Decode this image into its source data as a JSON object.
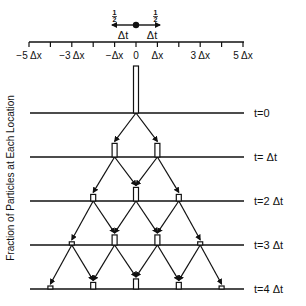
{
  "legend": {
    "left_fraction": "1/2",
    "right_fraction": "1/2",
    "left_label": "Δt",
    "right_label": "Δt"
  },
  "axis": {
    "tick_labels": [
      {
        "pos": -5,
        "text": "−5 Δx"
      },
      {
        "pos": -3,
        "text": "−3 Δx"
      },
      {
        "pos": -1,
        "text": "−Δx"
      },
      {
        "pos": 0,
        "text": "0"
      },
      {
        "pos": 1,
        "text": "Δx"
      },
      {
        "pos": 3,
        "text": "3 Δx"
      },
      {
        "pos": 5,
        "text": "5 Δx"
      }
    ],
    "tick_range": [
      -5,
      5
    ]
  },
  "ylabel": "Fraction of Particles at Each Location",
  "time_steps": [
    {
      "label": "t=0",
      "bars": [
        {
          "pos": 0,
          "fraction": 1
        }
      ]
    },
    {
      "label": "t= Δt",
      "bars": [
        {
          "pos": -1,
          "fraction": 0.5
        },
        {
          "pos": 1,
          "fraction": 0.5
        }
      ]
    },
    {
      "label": "t=2 Δt",
      "bars": [
        {
          "pos": -2,
          "fraction": 0.25
        },
        {
          "pos": 0,
          "fraction": 0.5
        },
        {
          "pos": 2,
          "fraction": 0.25
        }
      ]
    },
    {
      "label": "t=3 Δt",
      "bars": [
        {
          "pos": -3,
          "fraction": 0.125
        },
        {
          "pos": -1,
          "fraction": 0.375
        },
        {
          "pos": 1,
          "fraction": 0.375
        },
        {
          "pos": 3,
          "fraction": 0.125
        }
      ]
    },
    {
      "label": "t=4 Δt",
      "bars": [
        {
          "pos": -4,
          "fraction": 0.0625
        },
        {
          "pos": -2,
          "fraction": 0.25
        },
        {
          "pos": 0,
          "fraction": 0.375
        },
        {
          "pos": 2,
          "fraction": 0.25
        },
        {
          "pos": 4,
          "fraction": 0.0625
        }
      ]
    }
  ]
}
